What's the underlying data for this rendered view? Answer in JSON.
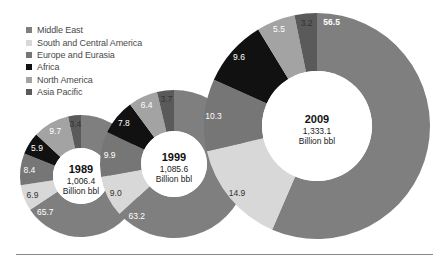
{
  "chart_data": {
    "type": "pie",
    "subtype": "donut",
    "title": "",
    "unit": "percent share of proved oil reserves",
    "legend": {
      "position": "top-left",
      "entries": [
        {
          "name": "Middle East",
          "color": "#7f7f7f"
        },
        {
          "name": "South and Central America",
          "color": "#d8d8d8"
        },
        {
          "name": "Europe and Eurasia",
          "color": "#767676"
        },
        {
          "name": "Africa",
          "color": "#111111"
        },
        {
          "name": "North America",
          "color": "#a3a3a3"
        },
        {
          "name": "Asia Pacific",
          "color": "#5a5a5a"
        }
      ]
    },
    "categories": [
      "Middle East",
      "South and Central America",
      "Europe and Eurasia",
      "Africa",
      "North America",
      "Asia Pacific"
    ],
    "charts": [
      {
        "year": "1989",
        "total": "1,006.4",
        "total_unit": "Billion bbl",
        "values": [
          65.7,
          6.9,
          8.4,
          5.9,
          9.7,
          3.4
        ],
        "labels": [
          "65.7",
          "6.9",
          "8.4",
          "5.9",
          "9.7",
          "3.4"
        ],
        "cx": 81,
        "cy": 176,
        "r_outer": 61,
        "r_inner": 28,
        "year_size": 11,
        "sub_size": 8.5
      },
      {
        "year": "1999",
        "total": "1,085.6",
        "total_unit": "Billion bbl",
        "values": [
          63.2,
          9.0,
          9.9,
          7.8,
          6.4,
          3.7
        ],
        "labels": [
          "63.2",
          "9.0",
          "9.9",
          "7.8",
          "6.4",
          "3.7"
        ],
        "cx": 174,
        "cy": 164,
        "r_outer": 74,
        "r_inner": 33,
        "year_size": 11,
        "sub_size": 8.5
      },
      {
        "year": "2009",
        "total": "1,333.1",
        "total_unit": "Billion bbl",
        "values": [
          56.5,
          14.9,
          10.3,
          9.6,
          5.5,
          3.2
        ],
        "labels": [
          "56.5",
          "14.9",
          "10.3",
          "9.6",
          "5.5",
          "3.2"
        ],
        "cx": 317,
        "cy": 126,
        "r_outer": 113,
        "r_inner": 55,
        "year_size": 11,
        "sub_size": 8.5
      }
    ],
    "label_colors": [
      "#ffffff",
      "#333333",
      "#ffffff",
      "#ffffff",
      "#ffffff",
      "#333333"
    ],
    "start_angle_deg": 0,
    "direction": "clockwise",
    "grid": false
  },
  "legend_labels": [
    "Middle East",
    "South and Central America",
    "Europe and Eurasia",
    "Africa",
    "North America",
    "Asia Pacific"
  ]
}
